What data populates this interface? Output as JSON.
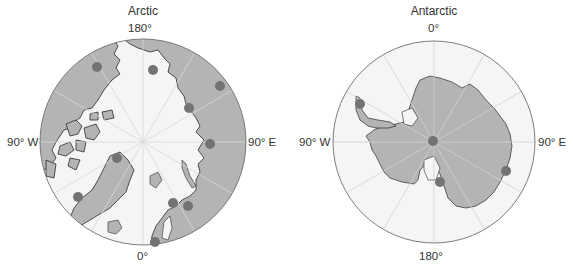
{
  "figure": {
    "panels": [
      {
        "id": "arctic",
        "title": "Arctic",
        "labels": {
          "top": "180°",
          "bottom": "0°",
          "left": "90° W",
          "right": "90° E"
        },
        "center": [
          143,
          142
        ],
        "radius": 103,
        "stations": [
          [
            97,
            67
          ],
          [
            153,
            70
          ],
          [
            220,
            86
          ],
          [
            189,
            108
          ],
          [
            210,
            144
          ],
          [
            117,
            158
          ],
          [
            78,
            197
          ],
          [
            173,
            203
          ],
          [
            188,
            206
          ],
          [
            155,
            242
          ]
        ]
      },
      {
        "id": "antarctic",
        "title": "Antarctic",
        "labels": {
          "top": "0°",
          "bottom": "180°",
          "left": "90° W",
          "right": "90° E"
        },
        "center": [
          434,
          142
        ],
        "radius": 101,
        "stations": [
          [
            360,
            104
          ],
          [
            433,
            141
          ],
          [
            440,
            182
          ],
          [
            506,
            171
          ]
        ]
      }
    ],
    "colors": {
      "ocean": "#f5f5f5",
      "land": "#b4b4b4",
      "ice_edge": "#8c8c8c",
      "coast": "#2b2b2b",
      "graticule": "#d8d8d8",
      "station": "#737373",
      "rim": "#6e6e6e"
    }
  }
}
